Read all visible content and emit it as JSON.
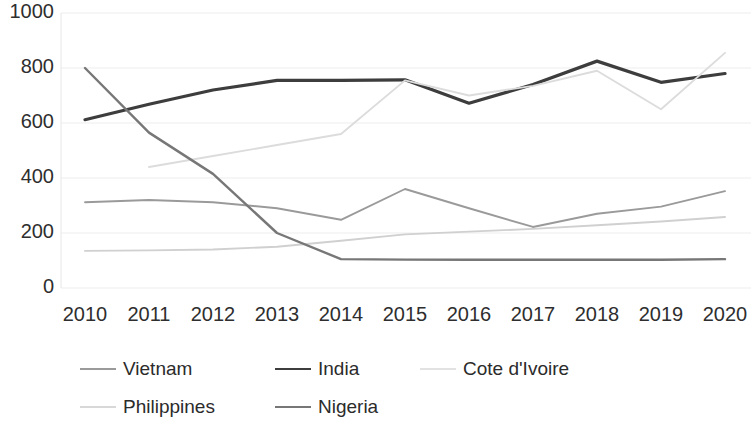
{
  "chart_data": {
    "type": "line",
    "title": "",
    "xlabel": "",
    "ylabel": "",
    "categories": [
      "2010",
      "2011",
      "2012",
      "2013",
      "2014",
      "2015",
      "2016",
      "2017",
      "2018",
      "2019",
      "2020"
    ],
    "x": [
      2010,
      2011,
      2012,
      2013,
      2014,
      2015,
      2016,
      2017,
      2018,
      2019,
      2020
    ],
    "ylim": [
      0,
      1000
    ],
    "yticks": [
      0,
      200,
      400,
      600,
      800,
      1000
    ],
    "ytick_labels": [
      "0",
      "200",
      "400",
      "600",
      "800",
      "1000"
    ],
    "grid": true,
    "grid_axis": "y",
    "legend_position": "bottom",
    "series": [
      {
        "name": "Vietnam",
        "color": "#9a9a9a",
        "values": [
          312,
          320,
          312,
          290,
          248,
          360,
          290,
          222,
          270,
          296,
          352
        ]
      },
      {
        "name": "India",
        "color": "#3d3d3d",
        "values": [
          612,
          668,
          720,
          755,
          755,
          757,
          672,
          740,
          825,
          748,
          780
        ]
      },
      {
        "name": "Cote d'Ivoire",
        "color": "#dcdcdc",
        "values": [
          null,
          440,
          480,
          520,
          560,
          755,
          700,
          735,
          790,
          650,
          855
        ]
      },
      {
        "name": "Philippines",
        "color": "#d0d0d0",
        "values": [
          135,
          137,
          140,
          150,
          172,
          195,
          205,
          215,
          228,
          242,
          258
        ]
      },
      {
        "name": "Nigeria",
        "color": "#777777",
        "values": [
          800,
          565,
          415,
          200,
          105,
          103,
          103,
          103,
          103,
          103,
          105
        ]
      }
    ]
  },
  "axis": {
    "y_labels": [
      "1000",
      "800",
      "600",
      "400",
      "200",
      "0"
    ],
    "x_labels": [
      "2010",
      "2011",
      "2012",
      "2013",
      "2014",
      "2015",
      "2016",
      "2017",
      "2018",
      "2019",
      "2020"
    ]
  },
  "legend": {
    "rows": [
      [
        {
          "label": "Vietnam",
          "color": "#9a9a9a"
        },
        {
          "label": "India",
          "color": "#3d3d3d"
        },
        {
          "label": "Cote d'Ivoire",
          "color": "#e2e2e2"
        }
      ],
      [
        {
          "label": "Philippines",
          "color": "#d8d8d8"
        },
        {
          "label": "Nigeria",
          "color": "#777777"
        }
      ]
    ]
  },
  "colors": {
    "grid": "#ededed",
    "axis_text": "#2e2e2e",
    "background": "#ffffff"
  }
}
